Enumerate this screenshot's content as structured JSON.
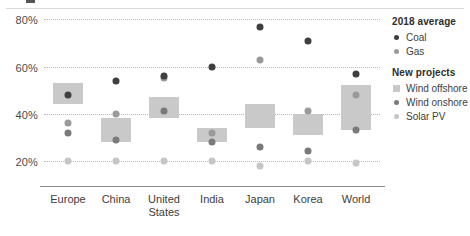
{
  "chart_data": {
    "type": "scatter",
    "title": "",
    "subtitle": "",
    "xlabel": "",
    "ylabel": "",
    "ylim": [
      14,
      84
    ],
    "yticks": [
      20,
      40,
      60,
      80
    ],
    "ytick_labels": [
      "20%",
      "40%",
      "60%",
      "80%"
    ],
    "grid": "horizontal-dotted",
    "legend_position": "right",
    "categories": [
      "Europe",
      "China",
      "United\nStates",
      "India",
      "Japan",
      "Korea",
      "World"
    ],
    "series": [
      {
        "name": "Coal",
        "group": "2018 average",
        "marker": "dot",
        "color": "#3f3f3f",
        "values": [
          48,
          54,
          56,
          60,
          77,
          71,
          57
        ]
      },
      {
        "name": "Gas",
        "group": "2018 average",
        "marker": "dot",
        "color": "#9a9a9a",
        "values": [
          36,
          40,
          55,
          32,
          63,
          41,
          48
        ]
      },
      {
        "name": "Wind offshore",
        "group": "New projects",
        "marker": "box",
        "color": "#c9c9c9",
        "ranges": [
          [
            44,
            53
          ],
          [
            28,
            38
          ],
          [
            38,
            47
          ],
          [
            28,
            34
          ],
          [
            34,
            44
          ],
          [
            31,
            40
          ],
          [
            33,
            52
          ]
        ]
      },
      {
        "name": "Wind onshore",
        "group": "New projects",
        "marker": "dot",
        "color": "#7a7a7a",
        "values": [
          32,
          29,
          41,
          28,
          26,
          24,
          33
        ]
      },
      {
        "name": "Solar PV",
        "group": "New projects",
        "marker": "dot",
        "color": "#c6c6c6",
        "values": [
          20,
          20,
          20,
          20,
          18,
          20,
          19
        ]
      }
    ]
  },
  "yaxis": {
    "ticks": [
      {
        "label": "80%",
        "value": 80
      },
      {
        "label": "60%",
        "value": 60
      },
      {
        "label": "40%",
        "value": 40
      },
      {
        "label": "20%",
        "value": 20
      }
    ]
  },
  "xaxis": {
    "labels": [
      "Europe",
      "China",
      "United\nStates",
      "India",
      "Japan",
      "Korea",
      "World"
    ]
  },
  "legend": {
    "groups": [
      {
        "heading": "2018 average",
        "items": [
          {
            "label": "Coal",
            "marker": "dot",
            "color": "#3f3f3f"
          },
          {
            "label": "Gas",
            "marker": "dot",
            "color": "#9a9a9a"
          }
        ]
      },
      {
        "heading": "New projects",
        "items": [
          {
            "label": "Wind offshore",
            "marker": "square",
            "color": "#c9c9c9"
          },
          {
            "label": "Wind onshore",
            "marker": "dot",
            "color": "#7a7a7a"
          },
          {
            "label": "Solar PV",
            "marker": "dot",
            "color": "#c6c6c6"
          }
        ]
      }
    ]
  }
}
